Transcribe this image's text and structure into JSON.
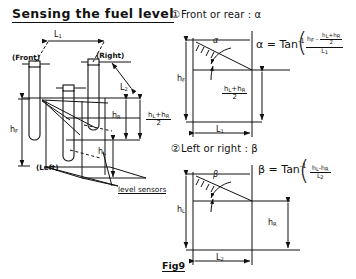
{
  "figure": {
    "title": "Sensing the fuel level",
    "fig_label": "Fig9",
    "background_color": "#ffffff",
    "ink_color": "#111111"
  },
  "tank_diagram": {
    "name": "isometric fuel tank with level sensors",
    "labels": {
      "front": "(Front)",
      "right": "(Right)",
      "left": "(Left)",
      "sensors": "level sensors",
      "L1": "L",
      "L1_sub": "1",
      "L2": "L",
      "L2_sub": "2",
      "hF": "h",
      "hF_sub": "F",
      "hR": "h",
      "hR_sub": "R",
      "hL": "h",
      "hL_sub": "L"
    },
    "mean_level": {
      "numerator_a": "h",
      "numerator_a_sub": "L",
      "plus": "+",
      "numerator_b": "h",
      "numerator_b_sub": "R",
      "denominator": "2"
    }
  },
  "section_front_rear": {
    "number": "①",
    "heading": "Front or rear : α",
    "angle_symbol": "α",
    "axis_labels": {
      "height": "h",
      "height_sub": "F",
      "base": "L",
      "base_sub": "1"
    },
    "inner_level": {
      "num_a": "h",
      "num_a_sub": "L",
      "plus": "+",
      "num_b": "h",
      "num_b_sub": "R",
      "den": "2"
    },
    "formula": {
      "lhs": "α = Tan",
      "exponent": "-1",
      "numerator_first": "h",
      "numerator_first_sub": "F",
      "minus": "-",
      "inner_num_a": "h",
      "inner_num_a_sub": "L",
      "inner_plus": "+",
      "inner_num_b": "h",
      "inner_num_b_sub": "R",
      "inner_den": "2",
      "denominator": "L",
      "denominator_sub": "1"
    }
  },
  "section_left_right": {
    "number": "②",
    "heading": "Left or right : β",
    "angle_symbol": "β",
    "axis_labels": {
      "height": "h",
      "height_sub": "L",
      "base": "L",
      "base_sub": "2",
      "right_height": "h",
      "right_height_sub": "R"
    },
    "formula": {
      "lhs": "β = Tan",
      "exponent": "-1",
      "numerator": "h",
      "numerator_sub_a": "L",
      "minus": "-h",
      "numerator_sub_b": "R",
      "denominator": "L",
      "denominator_sub": "2"
    }
  }
}
